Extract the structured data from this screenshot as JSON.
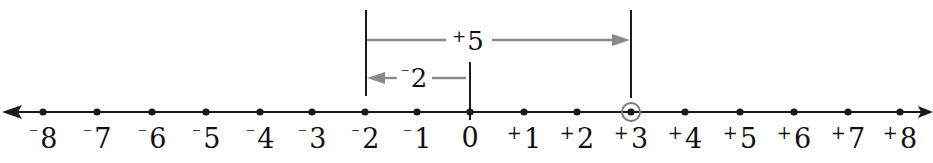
{
  "diagram": {
    "type": "number-line",
    "range": [
      -8,
      8
    ],
    "ticks": [
      {
        "value": -8,
        "sign": "⁻",
        "num": "8",
        "x": 43
      },
      {
        "value": -7,
        "sign": "⁻",
        "num": "7",
        "x": 97
      },
      {
        "value": -6,
        "sign": "⁻",
        "num": "6",
        "x": 152
      },
      {
        "value": -5,
        "sign": "⁻",
        "num": "5",
        "x": 206
      },
      {
        "value": -4,
        "sign": "⁻",
        "num": "4",
        "x": 260
      },
      {
        "value": -3,
        "sign": "⁻",
        "num": "3",
        "x": 312
      },
      {
        "value": -2,
        "sign": "⁻",
        "num": "2",
        "x": 365
      },
      {
        "value": -1,
        "sign": "⁻",
        "num": "1",
        "x": 417
      },
      {
        "value": 0,
        "sign": "",
        "num": "0",
        "x": 470
      },
      {
        "value": 1,
        "sign": "+",
        "num": "1",
        "x": 524
      },
      {
        "value": 2,
        "sign": "+",
        "num": "2",
        "x": 577
      },
      {
        "value": 3,
        "sign": "+",
        "num": "3",
        "x": 631
      },
      {
        "value": 4,
        "sign": "+",
        "num": "4",
        "x": 685
      },
      {
        "value": 5,
        "sign": "+",
        "num": "5",
        "x": 740
      },
      {
        "value": 6,
        "sign": "+",
        "num": "6",
        "x": 794
      },
      {
        "value": 7,
        "sign": "+",
        "num": "7",
        "x": 848
      },
      {
        "value": 8,
        "sign": "+",
        "num": "8",
        "x": 900
      }
    ],
    "highlighted_point": {
      "value": 3,
      "label": "+3"
    },
    "arrows": [
      {
        "name": "plus-five",
        "sign": "+",
        "num": "5",
        "from": -2,
        "to": 3,
        "direction": "right"
      },
      {
        "name": "minus-two",
        "sign": "⁻",
        "num": "2",
        "from": 0,
        "to": -2,
        "direction": "left"
      }
    ],
    "colors": {
      "line": "#1a1a1a",
      "arrow": "#8a8a8a",
      "highlight_ring": "#7a7a7a",
      "text": "#111111"
    }
  }
}
